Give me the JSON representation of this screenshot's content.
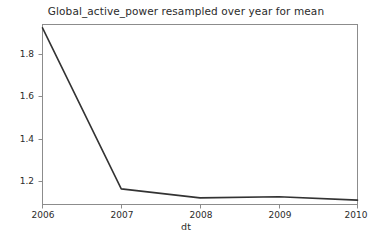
{
  "chart_data": {
    "type": "line",
    "title": "Global_active_power resampled over year for mean",
    "xlabel": "dt",
    "ylabel": "",
    "x": [
      2006,
      2007,
      2008,
      2009,
      2010
    ],
    "xtick_labels": [
      "2006",
      "2007",
      "2008",
      "2009",
      "2010"
    ],
    "ytick_labels": [
      "1.8",
      "1.6",
      "1.4",
      "1.2"
    ],
    "yticks": [
      1.8,
      1.6,
      1.4,
      1.2
    ],
    "series": [
      {
        "name": "Global_active_power",
        "values": [
          1.91,
          1.176,
          1.135,
          1.14,
          1.125
        ],
        "color": "#333333"
      }
    ],
    "xlim": [
      2006,
      2010
    ],
    "ylim": [
      1.105,
      1.925
    ],
    "grid": false,
    "legend": false,
    "legend_position": "none"
  },
  "figure": {
    "background_color": "#ffffff",
    "axes_color": "#8c8c8c",
    "text_color": "#2b2b2b"
  }
}
